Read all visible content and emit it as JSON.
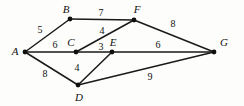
{
  "figure": {
    "type": "weighted-undirected-graph",
    "background_color": "#fdfdfb",
    "stroke_color": "#1a1a1a",
    "width": 244,
    "height": 106
  },
  "chart_data": {
    "type": "diagram",
    "title": "",
    "subtitle": "",
    "xlabel": "",
    "ylabel": "",
    "graph_type": "undirected weighted graph",
    "nodes": [
      {
        "id": "A",
        "label": "A",
        "x": 25,
        "y": 52,
        "label_x": 15,
        "label_y": 51
      },
      {
        "id": "B",
        "label": "B",
        "x": 70,
        "y": 19,
        "label_x": 66,
        "label_y": 9
      },
      {
        "id": "C",
        "label": "C",
        "x": 76,
        "y": 52,
        "label_x": 71,
        "label_y": 42
      },
      {
        "id": "D",
        "label": "D",
        "x": 78,
        "y": 85,
        "label_x": 79,
        "label_y": 97
      },
      {
        "id": "E",
        "label": "E",
        "x": 112,
        "y": 52,
        "label_x": 113,
        "label_y": 42
      },
      {
        "id": "F",
        "label": "F",
        "x": 134,
        "y": 20,
        "label_x": 137,
        "label_y": 9
      },
      {
        "id": "G",
        "label": "G",
        "x": 214,
        "y": 52,
        "label_x": 224,
        "label_y": 42
      }
    ],
    "edges": [
      {
        "source": "A",
        "target": "B",
        "weight": 5,
        "label_x": 40,
        "label_y": 30
      },
      {
        "source": "A",
        "target": "C",
        "weight": 6,
        "label_x": 55,
        "label_y": 45
      },
      {
        "source": "A",
        "target": "D",
        "weight": 8,
        "label_x": 45,
        "label_y": 74
      },
      {
        "source": "B",
        "target": "F",
        "weight": 7,
        "label_x": 101,
        "label_y": 13
      },
      {
        "source": "C",
        "target": "F",
        "weight": 4,
        "label_x": 102,
        "label_y": 31
      },
      {
        "source": "C",
        "target": "E",
        "weight": 3,
        "label_x": 101,
        "label_y": 47
      },
      {
        "source": "D",
        "target": "E",
        "weight": 4,
        "label_x": 77,
        "label_y": 68
      },
      {
        "source": "E",
        "target": "G",
        "weight": 6,
        "label_x": 158,
        "label_y": 45
      },
      {
        "source": "F",
        "target": "G",
        "weight": 8,
        "label_x": 173,
        "label_y": 24
      },
      {
        "source": "D",
        "target": "G",
        "weight": 9,
        "label_x": 150,
        "label_y": 77
      }
    ]
  }
}
